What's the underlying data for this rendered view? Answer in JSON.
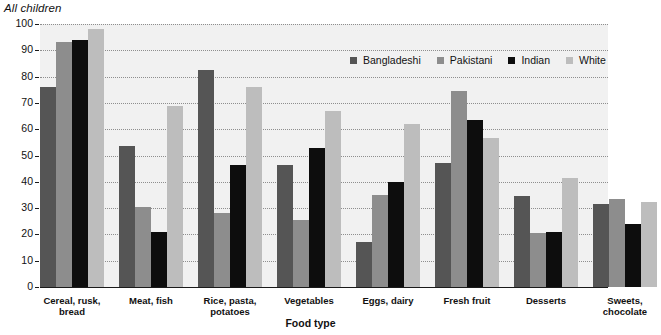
{
  "chart_data": {
    "type": "bar",
    "title": "All children",
    "xlabel": "Food type",
    "ylabel": "Percentage",
    "ylim": [
      0,
      100
    ],
    "ytick_step": 10,
    "yticks": [
      0,
      10,
      20,
      30,
      40,
      50,
      60,
      70,
      80,
      90,
      100
    ],
    "ytick_labels": [
      "0",
      "10",
      "20",
      "30",
      "40",
      "50",
      "60",
      "70",
      "80",
      "90",
      "100"
    ],
    "grid": true,
    "grid_style": "dotted-horizontal",
    "legend_position": "top-right inside plot",
    "categories": [
      "Cereal, rusk,\nbread",
      "Meat, fish",
      "Rice, pasta,\npotatoes",
      "Vegetables",
      "Eggs, dairy",
      "Fresh fruit",
      "Desserts",
      "Sweets,\nchocolate"
    ],
    "series": [
      {
        "name": "Bangladeshi",
        "color": "#555555",
        "values": [
          76,
          53.5,
          82.5,
          46.5,
          17,
          47,
          34.5,
          31.5
        ]
      },
      {
        "name": "Pakistani",
        "color": "#8d8d8d",
        "values": [
          93,
          30.5,
          28,
          25.5,
          35,
          74.5,
          20.5,
          33.5
        ]
      },
      {
        "name": "Indian",
        "color": "#0d0d0d",
        "values": [
          94,
          21,
          46.5,
          53,
          40,
          63.5,
          21,
          24
        ]
      },
      {
        "name": "White",
        "color": "#bdbdbd",
        "values": [
          98,
          69,
          76,
          67,
          62,
          56.5,
          41.5,
          32.5
        ]
      }
    ]
  },
  "colors": {
    "plot_background": "#f1f1f1",
    "gridline": "#8e8e8e",
    "axis": "#1a1a1a",
    "text": "#111111"
  }
}
